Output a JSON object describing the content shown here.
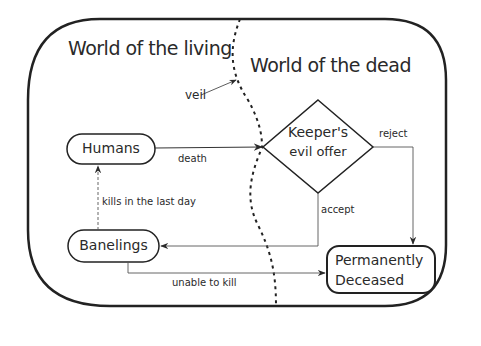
{
  "regions": {
    "living": "World of the living",
    "dead": "World of the dead"
  },
  "labels": {
    "veil": "veil"
  },
  "nodes": {
    "humans": "Humans",
    "banelings": "Banelings",
    "keeper_line1": "Keeper's",
    "keeper_line2": "evil offer",
    "deceased_line1": "Permanently",
    "deceased_line2": "Deceased"
  },
  "edges": {
    "death": "death",
    "reject": "reject",
    "accept": "accept",
    "kills": "kills in the last day",
    "unable": "unable to kill"
  }
}
